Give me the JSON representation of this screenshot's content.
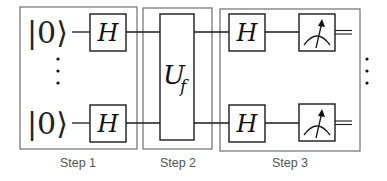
{
  "diagram": {
    "type": "quantum-circuit",
    "inputs": [
      {
        "label": "|0⟩"
      },
      {
        "label": "|0⟩"
      }
    ],
    "ellipsis": "⋮",
    "steps": [
      {
        "label": "Step 1",
        "gates": [
          "H",
          "H"
        ]
      },
      {
        "label": "Step 2",
        "gates": [
          "U_f"
        ],
        "oracle_main": "U",
        "oracle_sub": "f"
      },
      {
        "label": "Step 3",
        "gates": [
          "H",
          "H",
          "measure",
          "measure"
        ]
      }
    ],
    "colors": {
      "line": "#1a1a1a",
      "step_box": "#6e6e6e",
      "step_label": "#555555"
    }
  }
}
